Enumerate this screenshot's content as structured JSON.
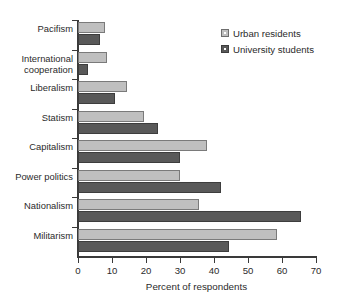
{
  "chart_data": {
    "type": "bar",
    "orientation": "horizontal",
    "title": "",
    "xlabel": "Percent of respondents",
    "ylabel": "",
    "xlim": [
      0,
      70
    ],
    "xticks": [
      0,
      10,
      20,
      30,
      40,
      50,
      60,
      70
    ],
    "xtick_labels": [
      "0",
      "10",
      "20",
      "30",
      "40",
      "50",
      "60",
      "70"
    ],
    "grid": false,
    "legend_position": "top-right",
    "categories": [
      "Pacifism",
      "International\ncooperation",
      "Liberalism",
      "Statism",
      "Capitalism",
      "Power politics",
      "Nationalism",
      "Militarism"
    ],
    "category_labels": [
      "Pacifism",
      "International cooperation",
      "Liberalism",
      "Statism",
      "Capitalism",
      "Power politics",
      "Nationalism",
      "Militarism"
    ],
    "series": [
      {
        "name": "Urban residents",
        "color": "#bfbfbf",
        "values": [
          8,
          8.5,
          14.5,
          19.5,
          38,
          30,
          35.5,
          58.5
        ]
      },
      {
        "name": "University students",
        "color": "#595959",
        "values": [
          6.5,
          3,
          11,
          23.5,
          30,
          42,
          65.5,
          44.5
        ]
      }
    ]
  },
  "legend": {
    "entries": [
      {
        "label": "Urban residents"
      },
      {
        "label": "University students"
      }
    ]
  },
  "axis": {
    "x_title": "Percent of respondents"
  },
  "colors": {
    "urban_residents": "#bfbfbf",
    "university_students": "#595959",
    "axis": "#3a3a3a",
    "text": "#2b2b2b",
    "background": "#ffffff"
  }
}
